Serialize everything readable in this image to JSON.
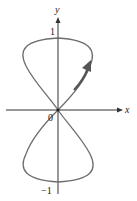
{
  "diagram": {
    "type": "polar-curve",
    "labels": {
      "y_axis": "y",
      "x_axis": "x",
      "top_tick": "1",
      "origin": "0",
      "bottom_tick": "−1"
    },
    "colors": {
      "axis": "#333333",
      "curve": "#6e6e6e",
      "arrow": "#555555",
      "background": "#ffffff"
    }
  }
}
